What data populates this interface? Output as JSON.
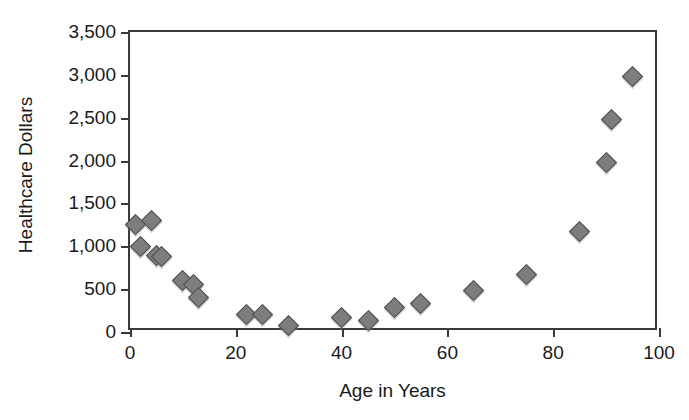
{
  "chart_data": {
    "type": "scatter",
    "title": "",
    "xlabel": "Age in Years",
    "ylabel": "Healthcare Dollars",
    "xlim": [
      0,
      100
    ],
    "ylim": [
      0,
      3500
    ],
    "xticks": [
      "0",
      "20",
      "40",
      "60",
      "80",
      "100"
    ],
    "xtick_values": [
      0,
      20,
      40,
      60,
      80,
      100
    ],
    "yticks": [
      "0",
      "500",
      "1,000",
      "1,500",
      "2,000",
      "2,500",
      "3,000",
      "3,500"
    ],
    "ytick_values": [
      0,
      500,
      1000,
      1500,
      2000,
      2500,
      3000,
      3500
    ],
    "grid": false,
    "legend": "none",
    "marker": "diamond",
    "marker_color": "#7d7d7d",
    "marker_edge_color": "#4a4a4a",
    "axis_color": "#3a3a3a",
    "text_color": "#1a1a1a",
    "background": "#ffffff",
    "x": [
      1,
      2,
      4,
      5,
      6,
      10,
      12,
      13,
      22,
      25,
      30,
      40,
      45,
      50,
      55,
      65,
      75,
      85,
      90,
      91,
      95
    ],
    "y": [
      1250,
      1000,
      1300,
      890,
      880,
      600,
      560,
      400,
      210,
      205,
      80,
      165,
      140,
      290,
      330,
      490,
      675,
      1170,
      1980,
      2480,
      2980
    ],
    "points": [
      {
        "x": 1,
        "y": 1250
      },
      {
        "x": 2,
        "y": 1000
      },
      {
        "x": 4,
        "y": 1300
      },
      {
        "x": 5,
        "y": 890
      },
      {
        "x": 6,
        "y": 880
      },
      {
        "x": 10,
        "y": 600
      },
      {
        "x": 12,
        "y": 560
      },
      {
        "x": 13,
        "y": 400
      },
      {
        "x": 22,
        "y": 210
      },
      {
        "x": 25,
        "y": 205
      },
      {
        "x": 30,
        "y": 80
      },
      {
        "x": 40,
        "y": 165
      },
      {
        "x": 45,
        "y": 140
      },
      {
        "x": 50,
        "y": 290
      },
      {
        "x": 55,
        "y": 330
      },
      {
        "x": 65,
        "y": 490
      },
      {
        "x": 75,
        "y": 675
      },
      {
        "x": 85,
        "y": 1170
      },
      {
        "x": 90,
        "y": 1980
      },
      {
        "x": 91,
        "y": 2480
      },
      {
        "x": 95,
        "y": 2980
      }
    ]
  }
}
